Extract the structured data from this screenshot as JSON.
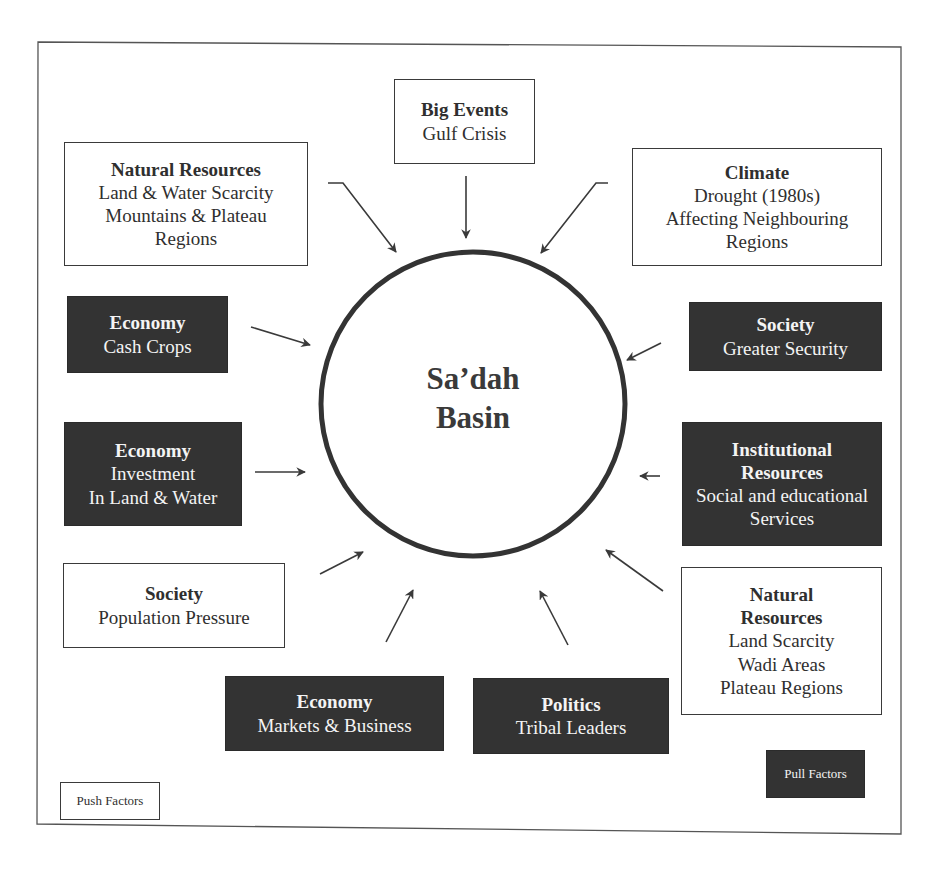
{
  "diagram": {
    "center": {
      "line1": "Sa’dah",
      "line2": "Basin"
    },
    "legend": {
      "push": "Push Factors",
      "pull": "Pull Factors"
    },
    "colors": {
      "push_fill": "#ffffff",
      "pull_fill": "#333333",
      "stroke": "#3a3a3a"
    },
    "factors": [
      {
        "id": "natural-resources-tl",
        "type": "push",
        "title": "Natural Resources",
        "lines": [
          "Land & Water Scarcity",
          "Mountains & Plateau",
          "Regions"
        ]
      },
      {
        "id": "big-events",
        "type": "push",
        "title": "Big Events",
        "lines": [
          "Gulf Crisis"
        ]
      },
      {
        "id": "climate",
        "type": "push",
        "title": "Climate",
        "lines": [
          "Drought (1980s)",
          "Affecting Neighbouring",
          "Regions"
        ]
      },
      {
        "id": "economy-cash-crops",
        "type": "pull",
        "title": "Economy",
        "lines": [
          "Cash Crops"
        ]
      },
      {
        "id": "society-security",
        "type": "pull",
        "title": "Society",
        "lines": [
          "Greater Security"
        ]
      },
      {
        "id": "economy-investment",
        "type": "pull",
        "title": "Economy",
        "lines": [
          "Investment",
          "In Land & Water"
        ]
      },
      {
        "id": "institutional-resources",
        "type": "pull",
        "title": "Institutional Resources",
        "title_lines": [
          "Institutional",
          "Resources"
        ],
        "lines": [
          "Social and educational",
          "Services"
        ]
      },
      {
        "id": "society-population",
        "type": "push",
        "title": "Society",
        "lines": [
          "Population Pressure"
        ]
      },
      {
        "id": "natural-resources-br",
        "type": "push",
        "title": "Natural Resources",
        "title_lines": [
          "Natural",
          "Resources"
        ],
        "lines": [
          "Land Scarcity",
          "Wadi Areas",
          "Plateau Regions"
        ]
      },
      {
        "id": "economy-markets",
        "type": "pull",
        "title": "Economy",
        "lines": [
          "Markets & Business"
        ]
      },
      {
        "id": "politics",
        "type": "pull",
        "title": "Politics",
        "lines": [
          "Tribal Leaders"
        ]
      }
    ]
  }
}
